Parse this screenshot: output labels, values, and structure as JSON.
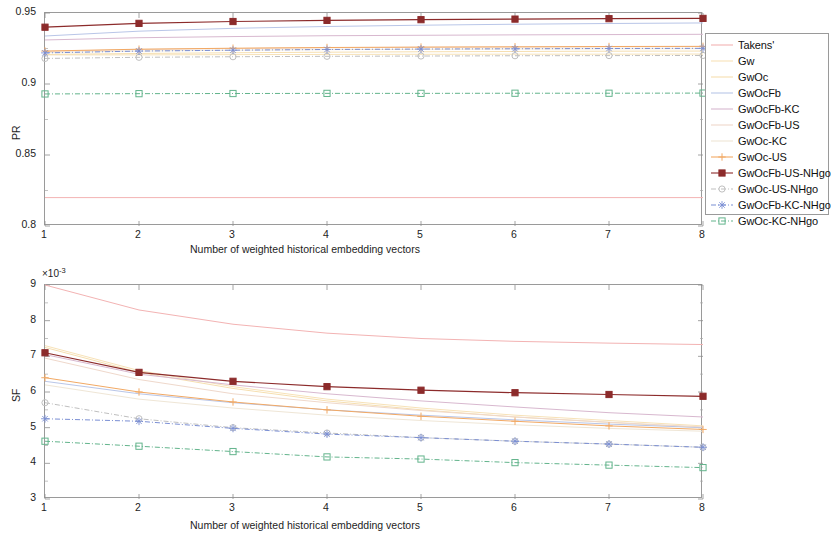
{
  "figure": {
    "width": 830,
    "height": 538,
    "background": "#ffffff"
  },
  "legend": {
    "position": "outside-right-top",
    "entries": [
      {
        "label": "Takens'",
        "color": "#f3b3b3",
        "marker": "none",
        "style": "solid"
      },
      {
        "label": "Gw",
        "color": "#f7e2b8",
        "marker": "none",
        "style": "solid"
      },
      {
        "label": "GwOc",
        "color": "#f6dfb0",
        "marker": "none",
        "style": "solid"
      },
      {
        "label": "GwOcFb",
        "color": "#b9c6e8",
        "marker": "none",
        "style": "solid"
      },
      {
        "label": "GwOcFb-KC",
        "color": "#d8b8cf",
        "marker": "none",
        "style": "solid"
      },
      {
        "label": "GwOcFb-US",
        "color": "#efd8cb",
        "marker": "none",
        "style": "solid"
      },
      {
        "label": "GwOc-KC",
        "color": "#efe6d6",
        "marker": "none",
        "style": "solid"
      },
      {
        "label": "GwOc-US",
        "color": "#f2a964",
        "marker": "plus",
        "style": "solid"
      },
      {
        "label": "GwOcFb-US-NHgo",
        "color": "#8c2b2b",
        "marker": "square-filled",
        "style": "solid"
      },
      {
        "label": "GwOc-US-NHgo",
        "color": "#bfbfbf",
        "marker": "circle",
        "style": "dashdot"
      },
      {
        "label": "GwOcFb-KC-NHgo",
        "color": "#7b8fd4",
        "marker": "star",
        "style": "dashdot"
      },
      {
        "label": "GwOc-KC-NHgo",
        "color": "#63b48c",
        "marker": "square",
        "style": "dashdot"
      }
    ]
  },
  "chart_data": [
    {
      "id": "pr",
      "type": "line",
      "title": "",
      "xlabel": "Number of weighted historical embedding vectors",
      "ylabel": "PR",
      "x": [
        1,
        2,
        3,
        4,
        5,
        6,
        7,
        8
      ],
      "xlim": [
        1,
        8
      ],
      "ylim": [
        0.8,
        0.95
      ],
      "xticks": [
        1,
        2,
        3,
        4,
        5,
        6,
        7,
        8
      ],
      "yticks": [
        0.8,
        0.85,
        0.9,
        0.95
      ],
      "ytick_labels": [
        "0.8",
        "0.85",
        "0.9",
        "0.95"
      ],
      "grid": false,
      "series": [
        {
          "name": "Takens'",
          "color": "#f3b3b3",
          "marker": "none",
          "style": "solid",
          "values": [
            0.82,
            0.82,
            0.82,
            0.82,
            0.82,
            0.82,
            0.82,
            0.82
          ]
        },
        {
          "name": "Gw",
          "color": "#f7e2b8",
          "marker": "none",
          "style": "solid",
          "values": [
            0.9205,
            0.9205,
            0.9207,
            0.9208,
            0.9209,
            0.921,
            0.921,
            0.9211
          ]
        },
        {
          "name": "GwOc",
          "color": "#f6dfb0",
          "marker": "none",
          "style": "solid",
          "values": [
            0.9208,
            0.9215,
            0.922,
            0.9224,
            0.9227,
            0.9229,
            0.9231,
            0.9232
          ]
        },
        {
          "name": "GwOcFb",
          "color": "#b9c6e8",
          "marker": "none",
          "style": "solid",
          "values": [
            0.9338,
            0.9372,
            0.9392,
            0.9405,
            0.9414,
            0.9421,
            0.9426,
            0.943
          ]
        },
        {
          "name": "GwOcFb-KC",
          "color": "#d8b8cf",
          "marker": "none",
          "style": "solid",
          "values": [
            0.931,
            0.9326,
            0.9334,
            0.934,
            0.9343,
            0.9346,
            0.9348,
            0.935
          ]
        },
        {
          "name": "GwOcFb-US",
          "color": "#efd8cb",
          "marker": "none",
          "style": "solid",
          "values": [
            0.9229,
            0.9243,
            0.925,
            0.9255,
            0.9258,
            0.926,
            0.9262,
            0.9263
          ]
        },
        {
          "name": "GwOc-KC",
          "color": "#efe6d6",
          "marker": "none",
          "style": "solid",
          "values": [
            0.9222,
            0.9232,
            0.9238,
            0.9242,
            0.9245,
            0.9247,
            0.9248,
            0.9249
          ]
        },
        {
          "name": "GwOc-US",
          "color": "#f2a964",
          "marker": "plus",
          "style": "solid",
          "values": [
            0.9232,
            0.9245,
            0.9252,
            0.9257,
            0.926,
            0.9262,
            0.9264,
            0.9265
          ]
        },
        {
          "name": "GwOcFb-US-NHgo",
          "color": "#8c2b2b",
          "marker": "square-filled",
          "style": "solid",
          "values": [
            0.94,
            0.9427,
            0.944,
            0.9448,
            0.9453,
            0.9457,
            0.946,
            0.9462
          ]
        },
        {
          "name": "GwOc-US-NHgo",
          "color": "#bfbfbf",
          "marker": "circle",
          "style": "dashdot",
          "values": [
            0.918,
            0.9188,
            0.9192,
            0.9195,
            0.9197,
            0.9199,
            0.92,
            0.9201
          ]
        },
        {
          "name": "GwOcFb-KC-NHgo",
          "color": "#7b8fd4",
          "marker": "star",
          "style": "dashdot",
          "values": [
            0.9219,
            0.9232,
            0.9238,
            0.9243,
            0.9246,
            0.9248,
            0.925,
            0.9251
          ]
        },
        {
          "name": "GwOc-KC-NHgo",
          "color": "#63b48c",
          "marker": "square",
          "style": "dashdot",
          "values": [
            0.893,
            0.8932,
            0.8933,
            0.8934,
            0.8934,
            0.8935,
            0.8935,
            0.8936
          ]
        }
      ]
    },
    {
      "id": "sf",
      "type": "line",
      "title": "",
      "xlabel": "Number of weighted historical embedding vectors",
      "ylabel": "SF",
      "y_exponent_label": "×10",
      "y_exponent_power": "-3",
      "x": [
        1,
        2,
        3,
        4,
        5,
        6,
        7,
        8
      ],
      "xlim": [
        1,
        8
      ],
      "ylim": [
        3,
        9
      ],
      "xticks": [
        1,
        2,
        3,
        4,
        5,
        6,
        7,
        8
      ],
      "yticks": [
        3,
        4,
        5,
        6,
        7,
        8,
        9
      ],
      "ytick_labels": [
        "3",
        "4",
        "5",
        "6",
        "7",
        "8",
        "9"
      ],
      "grid": false,
      "series": [
        {
          "name": "Takens'",
          "color": "#f3b3b3",
          "marker": "none",
          "style": "solid",
          "values": [
            9.0,
            8.3,
            7.9,
            7.65,
            7.5,
            7.42,
            7.37,
            7.33
          ]
        },
        {
          "name": "Gw",
          "color": "#f7e2b8",
          "marker": "none",
          "style": "solid",
          "values": [
            7.3,
            6.6,
            6.15,
            5.8,
            5.55,
            5.35,
            5.2,
            5.05
          ]
        },
        {
          "name": "GwOc",
          "color": "#f6dfb0",
          "marker": "none",
          "style": "solid",
          "values": [
            7.25,
            6.55,
            6.1,
            5.75,
            5.5,
            5.3,
            5.15,
            5.0
          ]
        },
        {
          "name": "GwOcFb",
          "color": "#b9c6e8",
          "marker": "none",
          "style": "solid",
          "values": [
            6.3,
            5.95,
            5.7,
            5.5,
            5.35,
            5.22,
            5.1,
            5.0
          ]
        },
        {
          "name": "GwOcFb-KC",
          "color": "#d8b8cf",
          "marker": "none",
          "style": "solid",
          "values": [
            7.05,
            6.5,
            6.2,
            5.95,
            5.75,
            5.58,
            5.42,
            5.3
          ]
        },
        {
          "name": "GwOcFb-US",
          "color": "#efd8cb",
          "marker": "none",
          "style": "solid",
          "values": [
            6.95,
            6.35,
            5.95,
            5.7,
            5.48,
            5.3,
            5.15,
            5.02
          ]
        },
        {
          "name": "GwOc-KC",
          "color": "#efe6d6",
          "marker": "none",
          "style": "solid",
          "values": [
            6.2,
            5.8,
            5.55,
            5.35,
            5.2,
            5.08,
            4.98,
            4.9
          ]
        },
        {
          "name": "GwOc-US",
          "color": "#f2a964",
          "marker": "plus",
          "style": "solid",
          "values": [
            6.4,
            6.0,
            5.72,
            5.5,
            5.32,
            5.18,
            5.05,
            4.95
          ]
        },
        {
          "name": "GwOcFb-US-NHgo",
          "color": "#8c2b2b",
          "marker": "square-filled",
          "style": "solid",
          "values": [
            7.1,
            6.55,
            6.3,
            6.15,
            6.05,
            5.98,
            5.93,
            5.88
          ]
        },
        {
          "name": "GwOc-US-NHgo",
          "color": "#bfbfbf",
          "marker": "circle",
          "style": "dashdot",
          "values": [
            5.7,
            5.25,
            5.0,
            4.85,
            4.72,
            4.62,
            4.54,
            4.45
          ]
        },
        {
          "name": "GwOcFb-KC-NHgo",
          "color": "#7b8fd4",
          "marker": "star",
          "style": "dashdot",
          "values": [
            5.25,
            5.18,
            4.98,
            4.82,
            4.72,
            4.62,
            4.54,
            4.45
          ]
        },
        {
          "name": "GwOc-KC-NHgo",
          "color": "#63b48c",
          "marker": "square",
          "style": "dashdot",
          "values": [
            4.62,
            4.48,
            4.33,
            4.18,
            4.12,
            4.02,
            3.95,
            3.88
          ]
        }
      ]
    }
  ]
}
